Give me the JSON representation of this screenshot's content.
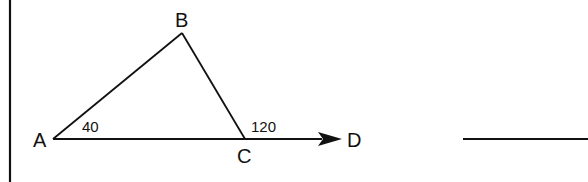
{
  "diagram": {
    "type": "geometry-triangle",
    "points": {
      "A": {
        "label": "A",
        "x": 53,
        "y": 139
      },
      "B": {
        "label": "B",
        "x": 182,
        "y": 33
      },
      "C": {
        "label": "C",
        "x": 245,
        "y": 139
      },
      "D": {
        "label": "D",
        "x": 342,
        "y": 139
      }
    },
    "angles": {
      "A": {
        "value": "40"
      },
      "C_exterior": {
        "value": "120"
      }
    },
    "colors": {
      "stroke": "#111111",
      "background": "#ffffff"
    }
  }
}
